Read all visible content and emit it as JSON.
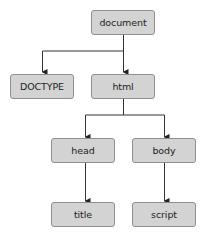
{
  "diagram": {
    "type": "tree",
    "colors": {
      "node_fill": "#d3d3d3",
      "node_border": "#8f8f8f",
      "text": "#222222",
      "edge": "#333333"
    },
    "nodes": {
      "document": {
        "label": "document"
      },
      "doctype": {
        "label": "DOCTYPE"
      },
      "html": {
        "label": "html"
      },
      "head": {
        "label": "head"
      },
      "body": {
        "label": "body"
      },
      "title": {
        "label": "title"
      },
      "script": {
        "label": "script"
      }
    },
    "edges": [
      {
        "from": "document",
        "to": "DOCTYPE"
      },
      {
        "from": "document",
        "to": "html"
      },
      {
        "from": "html",
        "to": "head"
      },
      {
        "from": "html",
        "to": "body"
      },
      {
        "from": "head",
        "to": "title"
      },
      {
        "from": "body",
        "to": "script"
      }
    ]
  }
}
